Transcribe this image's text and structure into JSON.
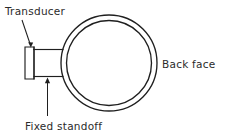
{
  "figure": {
    "background_color": "#ffffff",
    "line_color": "#1f1f1f",
    "text_color": "#2b2b2b"
  },
  "labels": {
    "transducer": "Transducer",
    "fixed_standoff": "Fixed standoff",
    "back_face": "Back face"
  },
  "geometry": {
    "pipe": {
      "center_x": 109,
      "center_y": 63,
      "outer_radius": 48,
      "inner_radius": 42.5
    },
    "transducer_block": {
      "x": 25,
      "y": 47,
      "width": 9,
      "height": 32
    },
    "standoff_block": {
      "x": 34,
      "y": 49.5,
      "width": 38,
      "height": 27
    },
    "transducer_leader": {
      "from_x": 22,
      "from_y": 20,
      "to_x": 30.5,
      "to_y": 46
    },
    "standoff_leader": {
      "from_x": 47.5,
      "from_y": 116,
      "to_x": 47.5,
      "to_y": 79
    }
  },
  "text_positions": {
    "transducer": {
      "x": 5,
      "y": 15
    },
    "fixed_standoff": {
      "x": 25,
      "y": 130
    },
    "back_face": {
      "x": 162,
      "y": 68
    }
  }
}
